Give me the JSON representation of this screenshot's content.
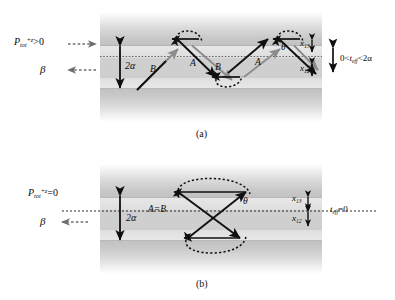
{
  "figure": {
    "type": "optics-ray-diagram"
  },
  "panel_a": {
    "caption": "(a)",
    "left_labels": {
      "power_symbol": "P",
      "power_sub": "tot",
      "power_sup": "+z",
      "power_relation": ">0",
      "beta": "β"
    },
    "core_thickness_label": "2α",
    "right_labels": {
      "x13": "x",
      "x13_sub": "13",
      "x12": "x",
      "x12_sub": "12",
      "teff_prefix": "0<",
      "teff_symbol": "t",
      "teff_sub": "eff",
      "teff_suffix": "<2α"
    },
    "ray_labels": {
      "a1": "A",
      "a2": "A",
      "b1": "B",
      "b2": "B",
      "theta": "θ"
    }
  },
  "panel_b": {
    "caption": "(b)",
    "left_labels": {
      "power_symbol": "P",
      "power_sub": "tot",
      "power_sup": "+z",
      "power_relation": "=0",
      "beta": "β"
    },
    "core_thickness_label": "2α",
    "right_labels": {
      "x13": "x",
      "x13_sub": "13",
      "x12": "x",
      "x12_sub": "12",
      "teff_symbol": "t",
      "teff_sub": "eff",
      "teff_suffix": "=0"
    },
    "ray_labels": {
      "ab": "A=B",
      "theta": "θ"
    }
  },
  "colors": {
    "ray_gray": "#8c8c8c",
    "ray_black": "#101010",
    "dashed_gray": "#6e6e6e",
    "core_fill": "#d6d6d6",
    "clad_dark": "#c2c2c2",
    "background": "#ffffff"
  }
}
